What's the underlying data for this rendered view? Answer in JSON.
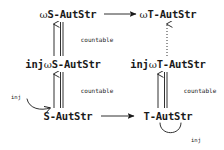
{
  "diagram": {
    "background_color": "#ffffff",
    "ink_color": "#1a1a1a",
    "nodes": [
      {
        "id": "omega-s-autstr",
        "label_prefix": "",
        "label_omega": "ω",
        "label_suffix": "S-AutStr",
        "full": "ωS-AutStr",
        "x": 68,
        "y": 14
      },
      {
        "id": "omega-t-autstr",
        "label_prefix": "",
        "label_omega": "ω",
        "label_suffix": "T-AutStr",
        "full": "ωT-AutStr",
        "x": 168,
        "y": 14
      },
      {
        "id": "inj-omega-s-autstr",
        "label_prefix": "inj",
        "label_omega": "ω",
        "label_suffix": "S-AutStr",
        "full": "injωS-AutStr",
        "x": 63,
        "y": 64
      },
      {
        "id": "inj-omega-t-autstr",
        "label_prefix": "inj",
        "label_omega": "ω",
        "label_suffix": "T-AutStr",
        "full": "injωT-AutStr",
        "x": 168,
        "y": 64
      },
      {
        "id": "s-autstr",
        "label_prefix": "",
        "label_omega": "",
        "label_suffix": "S-AutStr",
        "full": "S-AutStr",
        "x": 68,
        "y": 116
      },
      {
        "id": "t-autstr",
        "label_prefix": "",
        "label_omega": "",
        "label_suffix": "T-AutStr",
        "full": "T-AutStr",
        "x": 168,
        "y": 116
      }
    ],
    "edge_labels": [
      {
        "id": "countable-upper-left",
        "text": "countable",
        "x": 97,
        "y": 39
      },
      {
        "id": "countable-lower-left",
        "text": "countable",
        "x": 97,
        "y": 90
      },
      {
        "id": "countable-lower-right",
        "text": "countable",
        "x": 200,
        "y": 90
      },
      {
        "id": "inj-loop-left",
        "text": "inj",
        "x": 16,
        "y": 97
      },
      {
        "id": "inj-loop-right",
        "text": "inj",
        "x": 196,
        "y": 140
      }
    ],
    "edges": [
      {
        "id": "top-horizontal",
        "from": "omega-s-autstr",
        "to": "omega-t-autstr",
        "style": "solid",
        "arrowhead": "filled",
        "direction": "right"
      },
      {
        "id": "bottom-horizontal",
        "from": "s-autstr",
        "to": "t-autstr",
        "style": "solid",
        "arrowhead": "filled",
        "direction": "right"
      },
      {
        "id": "left-upper-vertical",
        "from": "inj-omega-s-autstr",
        "to": "omega-s-autstr",
        "style": "solid",
        "arrowhead": "open",
        "direction": "up",
        "label": "countable",
        "double_line": true
      },
      {
        "id": "left-lower-vertical",
        "from": "s-autstr",
        "to": "inj-omega-s-autstr",
        "style": "solid",
        "arrowhead": "open",
        "direction": "up",
        "label": "countable",
        "double_line": true
      },
      {
        "id": "right-upper-vertical",
        "from": "inj-omega-t-autstr",
        "to": "omega-t-autstr",
        "style": "dotted",
        "arrowhead": "open",
        "direction": "up",
        "label": "",
        "double_line": false
      },
      {
        "id": "right-lower-vertical",
        "from": "t-autstr",
        "to": "inj-omega-t-autstr",
        "style": "solid",
        "arrowhead": "open",
        "direction": "up",
        "label": "countable",
        "double_line": true
      },
      {
        "id": "loop-s-autstr-inj",
        "from": "s-autstr",
        "to": "s-autstr",
        "style": "solid",
        "arrowhead": "open",
        "direction": "curve-left-up",
        "label": "inj"
      },
      {
        "id": "loop-t-autstr-inj",
        "from": "t-autstr",
        "to": "t-autstr",
        "style": "solid",
        "arrowhead": "none",
        "direction": "curve-down",
        "label": "inj"
      }
    ]
  }
}
